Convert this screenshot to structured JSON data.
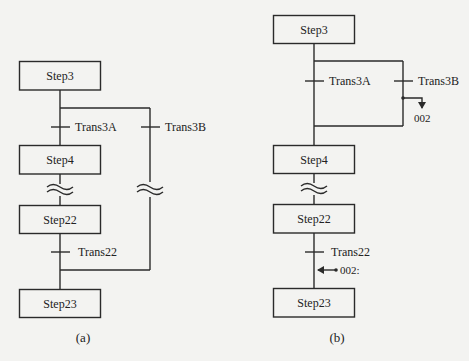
{
  "colors": {
    "background": "#f3f3f1",
    "stroke": "#2a2a2a",
    "text": "#222222"
  },
  "diagram_a": {
    "caption": "(a)",
    "steps": [
      {
        "id": "step3",
        "label": "Step3"
      },
      {
        "id": "step4",
        "label": "Step4"
      },
      {
        "id": "step22",
        "label": "Step22"
      },
      {
        "id": "step23",
        "label": "Step23"
      }
    ],
    "transitions": [
      {
        "id": "trans3a",
        "label": "Trans3A"
      },
      {
        "id": "trans3b",
        "label": "Trans3B"
      },
      {
        "id": "trans22",
        "label": "Trans22"
      }
    ]
  },
  "diagram_b": {
    "caption": "(b)",
    "steps": [
      {
        "id": "step3",
        "label": "Step3"
      },
      {
        "id": "step4",
        "label": "Step4"
      },
      {
        "id": "step22",
        "label": "Step22"
      },
      {
        "id": "step23",
        "label": "Step23"
      }
    ],
    "transitions": [
      {
        "id": "trans3a",
        "label": "Trans3A"
      },
      {
        "id": "trans3b",
        "label": "Trans3B"
      },
      {
        "id": "trans22",
        "label": "Trans22"
      }
    ],
    "jump_label": "002",
    "jump_target_label": "002:"
  }
}
